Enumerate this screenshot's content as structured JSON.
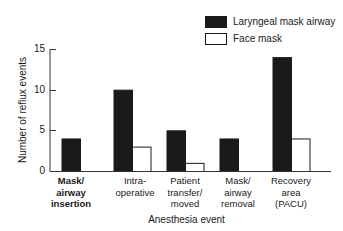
{
  "chart_data": {
    "type": "bar",
    "title": "",
    "xlabel": "Anesthesia event",
    "ylabel": "Number of reflux events",
    "ylim": [
      0,
      15
    ],
    "yticks": [
      0,
      5,
      10,
      15
    ],
    "grid": false,
    "legend_position": "top-right",
    "categories": [
      "Mask/\nairway\ninsertion",
      "Intra-\noperative",
      "Patient\ntransfer/\nmoved",
      "Mask/\nairway\nremoval",
      "Recovery\narea\n(PACU)"
    ],
    "series": [
      {
        "name": "Laryngeal mask airway",
        "color": "#1a1a1a",
        "values": [
          4,
          10,
          5,
          4,
          14
        ]
      },
      {
        "name": "Face mask",
        "color": "#ffffff",
        "values": [
          0,
          3,
          1,
          0,
          4
        ]
      }
    ]
  },
  "labels": {
    "ytick_0": "0",
    "ytick_5": "5",
    "ytick_10": "10",
    "ytick_15": "15"
  }
}
